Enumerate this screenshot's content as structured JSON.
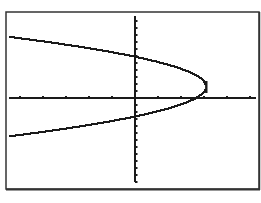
{
  "chart_data": {
    "type": "line",
    "title": "",
    "xlabel": "",
    "ylabel": "",
    "equation_form": "x = -a(y - k)^2 + h",
    "vertex": [
      3.1,
      1.6
    ],
    "y_intercepts": [
      5.9,
      -2.7
    ],
    "x_intercept": 2.7,
    "xlim": [
      -5.5,
      5.3
    ],
    "ylim": [
      -12,
      12
    ],
    "x_tick_step": 1,
    "y_tick_step": 1,
    "grid": false,
    "legend": null,
    "series": [
      {
        "name": "upper-branch",
        "points": [
          [
            -5.5,
            7.2
          ],
          [
            -4,
            6.9
          ],
          [
            -2,
            6.4
          ],
          [
            0,
            5.9
          ],
          [
            1,
            5.4
          ],
          [
            2,
            4.6
          ],
          [
            2.7,
            3.8
          ],
          [
            3.1,
            1.6
          ]
        ]
      },
      {
        "name": "lower-branch",
        "points": [
          [
            3.1,
            1.6
          ],
          [
            2.7,
            0.0
          ],
          [
            2,
            -0.8
          ],
          [
            1,
            -1.8
          ],
          [
            0,
            -2.7
          ],
          [
            -2,
            -3.4
          ],
          [
            -4,
            -4.0
          ],
          [
            -5.5,
            -4.3
          ]
        ]
      }
    ]
  },
  "colors": {
    "background": "#ffffff",
    "ink": "#1a1a1a",
    "frame": "#333333"
  },
  "layout": {
    "frame": {
      "x": 6,
      "y": 12,
      "w": 253,
      "h": 177
    },
    "origin_px": {
      "x": 135,
      "y": 98
    },
    "x_unit_px": 23,
    "y_unit_px": 7,
    "y_axis_top_px": 16,
    "y_axis_bottom_px": 182,
    "x_axis_left_px": 9,
    "x_axis_right_px": 256
  }
}
